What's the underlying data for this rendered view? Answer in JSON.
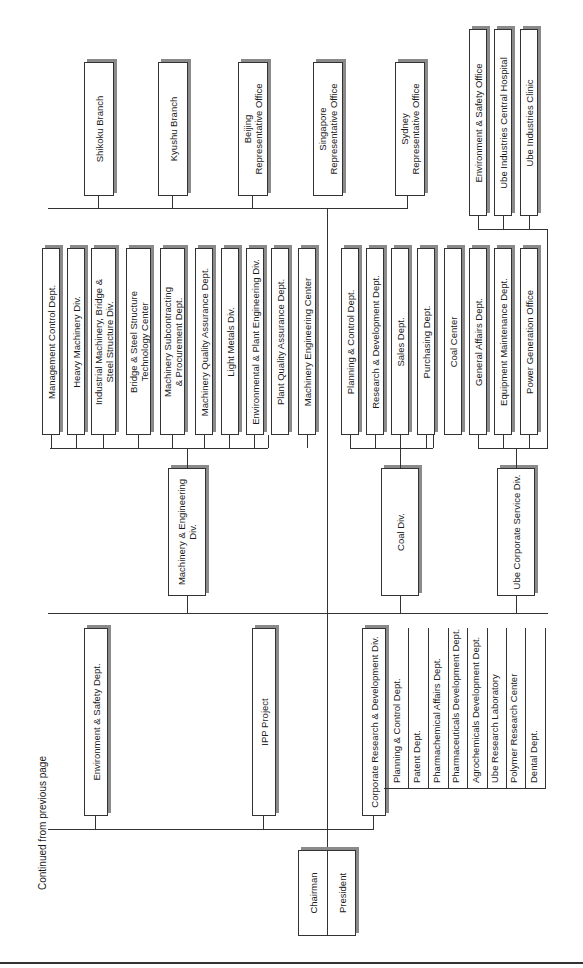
{
  "page": {
    "continued_note": "Continued from previous page"
  },
  "executive": {
    "chairman": "Chairman",
    "president": "President"
  },
  "branches": [
    {
      "label": "Shikoku Branch"
    },
    {
      "label": "Kyushu Branch"
    },
    {
      "label": "Beijing\nRepresentative Office"
    },
    {
      "label": "Singapore\nRepresentative Office"
    },
    {
      "label": "Sydney\nRepresentative Office"
    }
  ],
  "machinery_div": {
    "label": "Machinery & Engineering\nDiv.",
    "children": [
      {
        "label": "Management Control Dept."
      },
      {
        "label": "Heavy Machinery Div."
      },
      {
        "label": "Industrial Machinery, Bridge &\nSteel Structure Div."
      },
      {
        "label": "Bridge & Steel Structure\nTechnology Center"
      },
      {
        "label": "Machinery Subcontracting\n& Procurement Dept."
      },
      {
        "label": "Machinery Quality Assurance Dept."
      },
      {
        "label": "Light Metals Div."
      },
      {
        "label": "Environmental & Plant Engineering Div."
      },
      {
        "label": "Plant Quality Assurance Dept."
      },
      {
        "label": "Machinery Engineering Center"
      }
    ]
  },
  "coal_div": {
    "label": "Coal Div.",
    "children": [
      {
        "label": "Planning & Control Dept."
      },
      {
        "label": "Research & Development Dept."
      },
      {
        "label": "Sales Dept."
      },
      {
        "label": "Purchasing Dept."
      },
      {
        "label": "Coal Center"
      }
    ]
  },
  "service_div": {
    "label": "Ube Corporate Service Div.",
    "children": [
      {
        "label": "General Affairs Dept."
      },
      {
        "label": "Equipment Maintenance Dept."
      },
      {
        "label": "Power Generation Office"
      }
    ],
    "offices": [
      {
        "label": "Environment & Safety Office"
      },
      {
        "label": "Ube Industries Central Hospital"
      },
      {
        "label": "Ube Industries Clinic"
      }
    ]
  },
  "staff": {
    "env_safety": "Environment & Safety Dept.",
    "ipp": "IPP Project"
  },
  "rnd_div": {
    "label": "Corporate Research & Development Div.",
    "children": [
      {
        "label": "Planning & Control Dept."
      },
      {
        "label": "Patent Dept."
      },
      {
        "label": "Pharmachemical Affairs Dept."
      },
      {
        "label": "Pharmaceuticals Development Dept."
      },
      {
        "label": "Agrochemicals Development Dept."
      },
      {
        "label": "Ube Research Laboratory"
      },
      {
        "label": "Polymer Research Center"
      },
      {
        "label": "Dental Dept."
      }
    ]
  }
}
